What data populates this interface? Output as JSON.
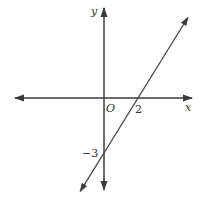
{
  "diagram": {
    "type": "coordinate-plane-line",
    "axes": {
      "x_label": "x",
      "y_label": "y",
      "origin_label": "O"
    },
    "line": {
      "equation": "y = (3/2)x - 3",
      "x_intercept": 2,
      "y_intercept": -3,
      "slope": 1.5
    },
    "labels": {
      "x_intercept_label": "2",
      "y_intercept_label": "−3"
    },
    "colors": {
      "axis": "#3a3a3a",
      "line": "#4a4a4a"
    }
  }
}
